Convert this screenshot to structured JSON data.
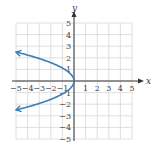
{
  "chart_data": {
    "type": "line",
    "title": "",
    "xlabel": "x",
    "ylabel": "y",
    "xlim": [
      -5,
      5
    ],
    "ylim": [
      -5,
      5
    ],
    "grid": true,
    "legend": null,
    "x_ticks": [
      "-5",
      "-4",
      "-3",
      "-2",
      "-1",
      "1",
      "2",
      "3",
      "4",
      "5"
    ],
    "y_ticks": [
      "5",
      "4",
      "3",
      "2",
      "1",
      "-1",
      "-2",
      "-3",
      "-4",
      "-5"
    ],
    "series": [
      {
        "name": "parabola opening left",
        "equation_approx": "x = -0.8y^2",
        "color": "#3a7fb5",
        "arrows_at_ends": true,
        "points": [
          {
            "x": -5.0,
            "y": 2.5
          },
          {
            "x": -3.2,
            "y": 2.0
          },
          {
            "x": -1.8,
            "y": 1.5
          },
          {
            "x": -0.8,
            "y": 1.0
          },
          {
            "x": -0.2,
            "y": 0.5
          },
          {
            "x": 0.0,
            "y": 0.0
          },
          {
            "x": -0.2,
            "y": -0.5
          },
          {
            "x": -0.8,
            "y": -1.0
          },
          {
            "x": -1.8,
            "y": -1.5
          },
          {
            "x": -3.2,
            "y": -2.0
          },
          {
            "x": -5.0,
            "y": -2.5
          }
        ]
      }
    ]
  },
  "colors": {
    "curve": "#3a7fb5",
    "axis": "#333333",
    "grid": "#d8d8d8",
    "background": "#ffffff"
  }
}
